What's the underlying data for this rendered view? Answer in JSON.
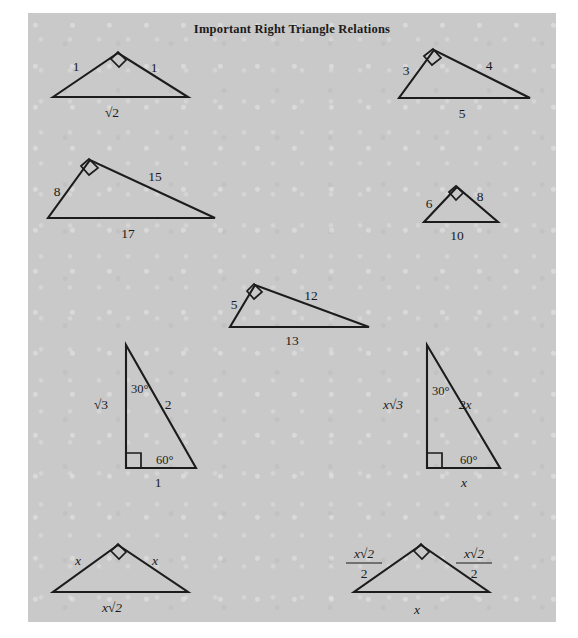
{
  "page": {
    "title": "Important Right Triangle Relations",
    "background_color": "#ffffff",
    "panel_color": "#c9c9c9",
    "ink_color": "#1b1b1b"
  },
  "figures": [
    {
      "id": "isosceles-right-1-1-root2",
      "name": "triangle-1-1-sqrt2",
      "orientation": "apex-up",
      "points": "25,84 90,40 160,84",
      "right_angle_at": "apex",
      "right_angle_marker": "83,46 90,39 98,47 91,54",
      "labels": [
        {
          "name": "left-leg-label",
          "text": "1",
          "x": 48,
          "y": 58,
          "style": "num"
        },
        {
          "name": "right-leg-label",
          "text": "1",
          "x": 126,
          "y": 59,
          "style": "num"
        },
        {
          "name": "base-label",
          "text": "√2",
          "x": 84,
          "y": 104,
          "style": "radical"
        }
      ]
    },
    {
      "id": "right-3-4-5",
      "name": "triangle-3-4-5",
      "orientation": "apex-left-of-center",
      "points": "371,85 502,85 406,37",
      "right_angle_at": "top-vertex",
      "right_angle_marker": "396,43 405,36 413,45 404,52",
      "labels": [
        {
          "name": "leg-3-label",
          "text": "3",
          "x": 378,
          "y": 62,
          "style": "num"
        },
        {
          "name": "leg-4-label",
          "text": "4",
          "x": 461,
          "y": 57,
          "style": "num"
        },
        {
          "name": "hypotenuse-5-label",
          "text": "5",
          "x": 434,
          "y": 105,
          "style": "num"
        }
      ]
    },
    {
      "id": "right-8-15-17",
      "name": "triangle-8-15-17",
      "orientation": "apex-left-of-center",
      "points": "20,205 187,205 62,147",
      "right_angle_at": "top-vertex",
      "right_angle_marker": "53,153 61,146 70,155 61,162",
      "labels": [
        {
          "name": "leg-8-label",
          "text": "8",
          "x": 29,
          "y": 183,
          "style": "num"
        },
        {
          "name": "leg-15-label",
          "text": "15",
          "x": 127,
          "y": 168,
          "style": "num"
        },
        {
          "name": "hypotenuse-17-label",
          "text": "17",
          "x": 100,
          "y": 225,
          "style": "num"
        }
      ]
    },
    {
      "id": "right-6-8-10",
      "name": "triangle-6-8-10",
      "orientation": "apex-left-of-center",
      "points": "396,209 470,209 429,174",
      "right_angle_at": "top-vertex",
      "right_angle_marker": "421,179 428,173 435,180 428,187",
      "labels": [
        {
          "name": "leg-6-label",
          "text": "6",
          "x": 401,
          "y": 195,
          "style": "num"
        },
        {
          "name": "leg-8-label",
          "text": "8",
          "x": 452,
          "y": 188,
          "style": "num"
        },
        {
          "name": "hypotenuse-10-label",
          "text": "10",
          "x": 429,
          "y": 227,
          "style": "num"
        }
      ]
    },
    {
      "id": "right-5-12-13",
      "name": "triangle-5-12-13",
      "orientation": "apex-left-of-center",
      "points": "202,314 341,314 227,272",
      "right_angle_at": "top-vertex",
      "right_angle_marker": "219,278 226,271 234,279 226,286",
      "labels": [
        {
          "name": "leg-5-label",
          "text": "5",
          "x": 206,
          "y": 296,
          "style": "num"
        },
        {
          "name": "leg-12-label",
          "text": "12",
          "x": 283,
          "y": 287,
          "style": "num"
        },
        {
          "name": "hypotenuse-13-label",
          "text": "13",
          "x": 264,
          "y": 332,
          "style": "num"
        }
      ]
    },
    {
      "id": "thirty-sixty-ninety-numeric",
      "name": "triangle-30-60-90-numeric",
      "orientation": "vertical-left-leg",
      "points": "98,332 98,455 168,455",
      "right_angle_at": "bottom-left",
      "right_angle_marker": "98,440 113,440 113,455",
      "labels": [
        {
          "name": "angle-30-label",
          "text": "30°",
          "x": 103,
          "y": 380,
          "style": "ang"
        },
        {
          "name": "vertical-leg-label",
          "text": "√3",
          "x": 73,
          "y": 396,
          "style": "radical"
        },
        {
          "name": "hypotenuse-2-label",
          "text": "2",
          "x": 140,
          "y": 396,
          "style": "num"
        },
        {
          "name": "angle-60-label",
          "text": "60°",
          "x": 128,
          "y": 451,
          "style": "ang"
        },
        {
          "name": "base-1-label",
          "text": "1",
          "x": 130,
          "y": 474,
          "style": "num"
        }
      ]
    },
    {
      "id": "thirty-sixty-ninety-variable",
      "name": "triangle-30-60-90-variable",
      "orientation": "vertical-left-leg",
      "points": "399,332 399,455 472,455",
      "right_angle_at": "bottom-left",
      "right_angle_marker": "399,440 414,440 414,455",
      "labels": [
        {
          "name": "angle-30-label",
          "text": "30°",
          "x": 404,
          "y": 382,
          "style": "ang"
        },
        {
          "name": "vertical-leg-label",
          "text": "x√3",
          "x": 365,
          "y": 396,
          "style": "varradical"
        },
        {
          "name": "hypotenuse-2x-label",
          "text": "2x",
          "x": 437,
          "y": 396,
          "style": "var"
        },
        {
          "name": "angle-60-label",
          "text": "60°",
          "x": 432,
          "y": 451,
          "style": "ang"
        },
        {
          "name": "base-x-label",
          "text": "x",
          "x": 436,
          "y": 474,
          "style": "var"
        }
      ]
    },
    {
      "id": "isosceles-right-x-x-xroot2",
      "name": "triangle-x-x-xsqrt2",
      "orientation": "apex-up",
      "points": "25,579 160,579 90,532",
      "right_angle_at": "apex",
      "right_angle_marker": "83,538 90,531 98,539 91,546",
      "labels": [
        {
          "name": "left-leg-label",
          "text": "x",
          "x": 50,
          "y": 552,
          "style": "var"
        },
        {
          "name": "right-leg-label",
          "text": "x",
          "x": 127,
          "y": 552,
          "style": "var"
        },
        {
          "name": "base-label",
          "text": "x√2",
          "x": 84,
          "y": 599,
          "style": "varradical"
        }
      ]
    },
    {
      "id": "isosceles-right-half-root2",
      "name": "triangle-half-sqrt2",
      "orientation": "apex-up",
      "points": "326,579 461,579 393,532",
      "right_angle_at": "apex",
      "right_angle_marker": "386,538 393,531 401,539 394,546",
      "labels": [
        {
          "name": "base-x-label",
          "text": "x",
          "x": 389,
          "y": 601,
          "style": "var"
        }
      ],
      "fractions": [
        {
          "name": "left-leg-fraction",
          "numerator": "x√2",
          "denominator": "2",
          "x": 336,
          "y": 545
        },
        {
          "name": "right-leg-fraction",
          "numerator": "x√2",
          "denominator": "2",
          "x": 446,
          "y": 545
        }
      ]
    }
  ]
}
